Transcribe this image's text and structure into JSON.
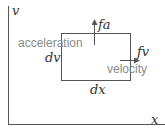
{
  "diagram": {
    "axes": {
      "y_label": "v",
      "x_label": "x"
    },
    "box": {
      "width_label": "dx",
      "height_label": "dv"
    },
    "flux_a": {
      "label": "fa",
      "caption": "acceleration"
    },
    "flux_v": {
      "label": "fv",
      "caption": "velocity"
    },
    "colors": {
      "line": "#555555",
      "math_text": "#333333",
      "caption_text": "#8a8a8a",
      "background": "#ffffff"
    }
  }
}
